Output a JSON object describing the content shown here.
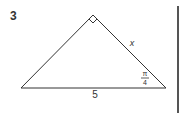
{
  "problem": {
    "number": "3",
    "figure": {
      "type": "right-triangle",
      "labels": {
        "hypotenuse_base": "5",
        "side": "x",
        "angle_numerator": "π",
        "angle_denominator": "4"
      },
      "right_angle_marker": true
    }
  },
  "colors": {
    "stroke": "#333333",
    "divider": "#555555"
  }
}
